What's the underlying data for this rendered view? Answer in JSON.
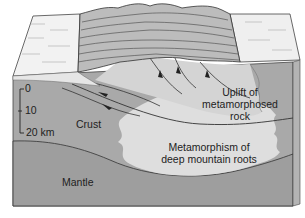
{
  "diagram": {
    "type": "block-diagram",
    "labels": {
      "uplift": [
        "Uplift of",
        "metamorphosed",
        "rock"
      ],
      "metamorphism": [
        "Metamorphism of",
        "deep mountain roots"
      ],
      "crust": "Crust",
      "mantle": "Mantle"
    },
    "scale_bar": {
      "ticks": [
        "0",
        "10",
        "20 km"
      ]
    },
    "colors": {
      "plain_surface": "#f4f4f4",
      "mountains": "#bdbdbd",
      "crust": "#a8a8a8",
      "mantle": "#9e9e9e",
      "metamorphic_zone": "#dedede",
      "uplift_zone": "#d2d2d2",
      "sediment": "#e8e8e8",
      "outline": "#333333",
      "side_face": "#b4b4b4"
    }
  }
}
